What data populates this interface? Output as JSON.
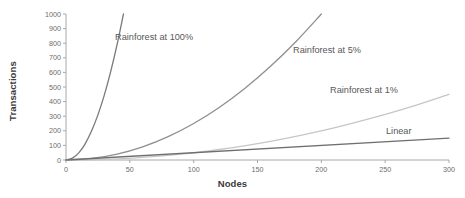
{
  "chart_data": {
    "type": "line",
    "title": "",
    "xlabel": "Nodes",
    "ylabel": "Transactions",
    "xlim": [
      0,
      300
    ],
    "ylim": [
      0,
      1000
    ],
    "xticks": [
      "0",
      "50",
      "100",
      "150",
      "200",
      "250",
      "300"
    ],
    "yticks": [
      "0",
      "100",
      "200",
      "300",
      "400",
      "500",
      "600",
      "700",
      "800",
      "900",
      "1000"
    ],
    "grid": false,
    "legend_position": "inline-labels",
    "series": [
      {
        "name": "Rainforest at 100%",
        "color": "#7d7d7d",
        "label_x": 115,
        "label_y": 32,
        "x": [
          0,
          5,
          10,
          15,
          20,
          25,
          30,
          35,
          40,
          45
        ],
        "values": [
          0,
          13,
          49,
          111,
          198,
          309,
          444,
          605,
          790,
          1000
        ]
      },
      {
        "name": "Rainforest at 5%",
        "color": "#909090",
        "label_x": 293,
        "label_y": 45,
        "x": [
          0,
          20,
          40,
          60,
          80,
          100,
          120,
          140,
          160,
          180,
          200
        ],
        "values": [
          0,
          10,
          40,
          90,
          160,
          250,
          360,
          490,
          640,
          810,
          1000
        ]
      },
      {
        "name": "Rainforest at 1%",
        "color": "#c6c6c6",
        "label_x": 330,
        "label_y": 85,
        "x": [
          0,
          30,
          60,
          90,
          120,
          150,
          180,
          210,
          240,
          270,
          300
        ],
        "values": [
          0,
          4,
          18,
          40,
          72,
          112,
          162,
          220,
          288,
          364,
          450
        ]
      },
      {
        "name": "Linear",
        "color": "#6f6f6f",
        "label_x": 386,
        "label_y": 126,
        "x": [
          0,
          300
        ],
        "values": [
          0,
          150
        ]
      }
    ]
  }
}
